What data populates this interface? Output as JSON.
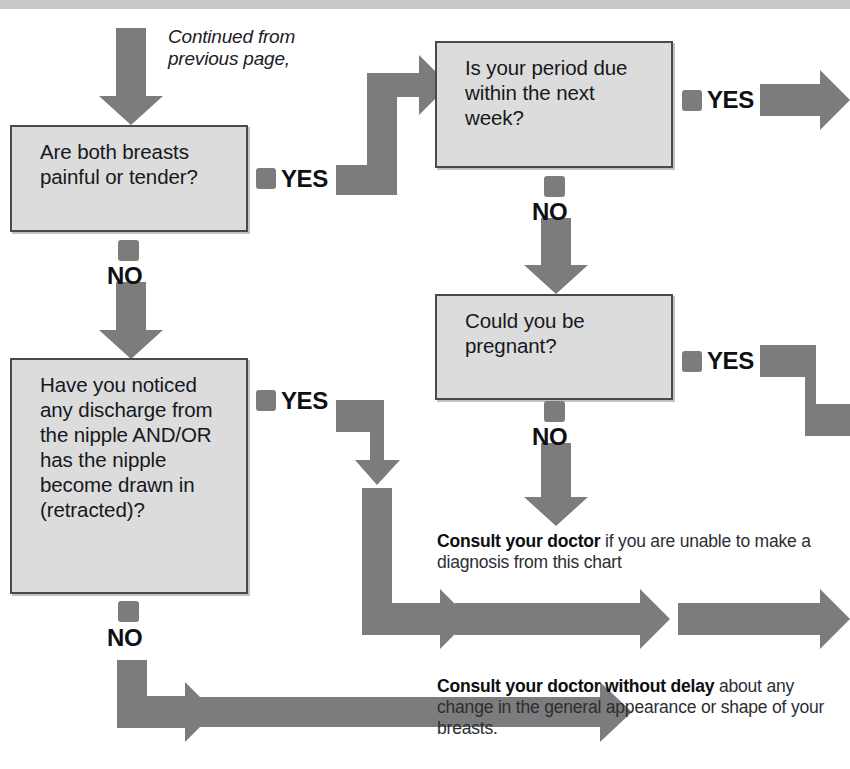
{
  "document": {
    "type": "medical-symptom-flowchart",
    "topic": "Breast problems",
    "top_band_color": "#c9c9c9",
    "arrow_color": "#7c7c7c",
    "box_fill_color": "#dcdcdc",
    "box_border_color": "#4a4a4a"
  },
  "continued_note": {
    "line1": "Continued from",
    "line2": "previous page,"
  },
  "boxes": [
    {
      "id": "q1",
      "text": "Are both breasts painful or tender?",
      "yes_label": "YES",
      "no_label": "NO"
    },
    {
      "id": "q2",
      "text": "Is your period due within the next week?",
      "yes_label": "YES",
      "no_label": "NO"
    },
    {
      "id": "q3",
      "text": "Have you noticed any discharge from the nipple AND/OR has the nipple become drawn in (retracted)?",
      "yes_label": "YES",
      "no_label": "NO"
    },
    {
      "id": "q4",
      "text": "Could you be pregnant?",
      "yes_label": "YES",
      "no_label": "NO"
    }
  ],
  "advice": [
    {
      "id": "advice-diagnosis",
      "bold": "Consult your doctor",
      "rest": " if you are unable to make a diagnosis from this chart"
    },
    {
      "id": "advice-without-delay",
      "bold": "Consult your doctor without delay",
      "rest": " about any change in the general appearance or shape of your breasts."
    }
  ]
}
